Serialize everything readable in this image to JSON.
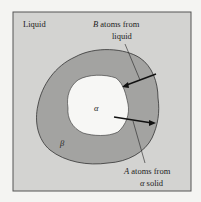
{
  "diagram": {
    "regions": {
      "liquid": "Liquid",
      "beta": "β",
      "alpha": "α"
    },
    "annotations": {
      "b_atoms_line1_var": "B",
      "b_atoms_line1_rest": " atoms from",
      "b_atoms_line2": "liquid",
      "a_atoms_line1_var": "A",
      "a_atoms_line1_rest": " atoms from",
      "a_atoms_line2_var": "α",
      "a_atoms_line2_rest": " solid"
    },
    "colors": {
      "liquid": "#d3d3d1",
      "beta": "#a3a3a1",
      "alpha": "#f7f7f5",
      "outline": "#333333"
    }
  }
}
